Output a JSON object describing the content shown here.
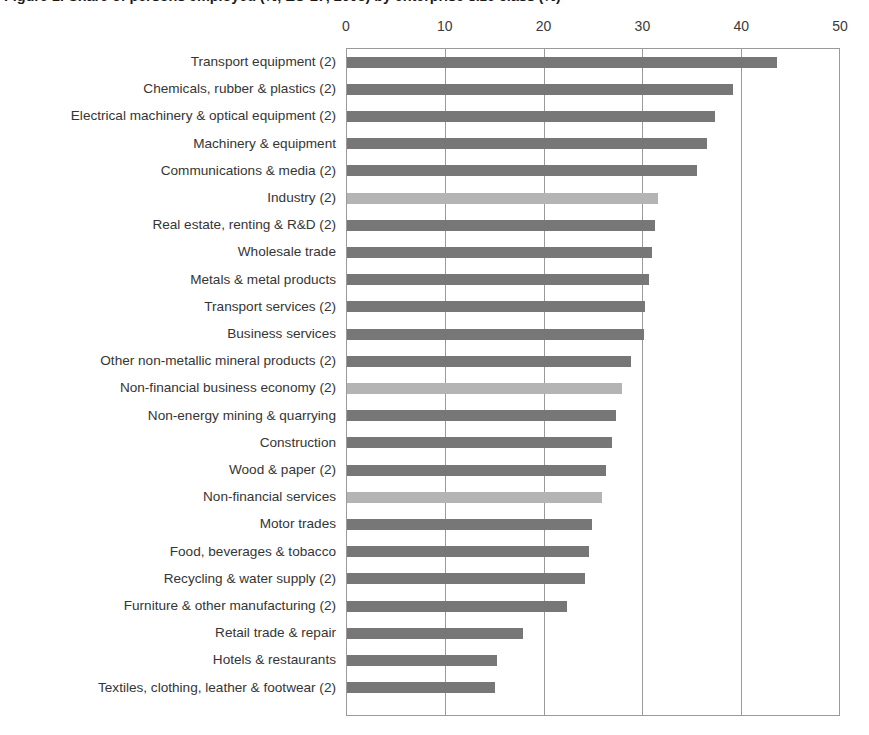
{
  "chart_data": {
    "type": "bar",
    "orientation": "horizontal",
    "title": "Figure 1: Share of persons employed (%, EU-27, 2008) by enterprise size class (%)",
    "xlabel": "",
    "ylabel": "",
    "xlim": [
      0,
      50
    ],
    "xticks": [
      0,
      10,
      20,
      30,
      40,
      50
    ],
    "xtick_labels": [
      "0",
      "10",
      "20",
      "30",
      "40",
      "50"
    ],
    "grid": true,
    "legend_position": "none",
    "colors": {
      "bar_primary": "#777777",
      "bar_aggregate": "#b4b4b4",
      "axis": "#9a9a9a",
      "text": "#353535",
      "background": "#ffffff"
    },
    "categories": [
      "Transport equipment (2)",
      "Chemicals, rubber & plastics (2)",
      "Electrical machinery & optical equipment (2)",
      "Machinery & equipment",
      "Communications & media (2)",
      "Industry (2)",
      "Real estate, renting & R&D (2)",
      "Wholesale trade",
      "Metals & metal products",
      "Transport services (2)",
      "Business services",
      "Other non-metallic mineral products (2)",
      "Non-financial business economy (2)",
      "Non-energy mining & quarrying",
      "Construction",
      "Wood & paper (2)",
      "Non-financial services",
      "Motor trades",
      "Food, beverages & tobacco",
      "Recycling & water supply (2)",
      "Furniture & other manufacturing (2)",
      "Retail trade & repair",
      "Hotels & restaurants",
      "Textiles, clothing, leather & footwear (2)"
    ],
    "values": [
      43.5,
      39.1,
      37.2,
      36.4,
      35.4,
      31.5,
      31.2,
      30.9,
      30.6,
      30.2,
      30.1,
      28.7,
      27.8,
      27.2,
      26.8,
      26.2,
      25.8,
      24.8,
      24.5,
      24.1,
      22.3,
      17.8,
      15.2,
      15.0
    ],
    "series_kinds": [
      "sector",
      "sector",
      "sector",
      "sector",
      "sector",
      "aggregate",
      "sector",
      "sector",
      "sector",
      "sector",
      "sector",
      "sector",
      "aggregate",
      "sector",
      "sector",
      "sector",
      "aggregate",
      "sector",
      "sector",
      "sector",
      "sector",
      "sector",
      "sector",
      "sector"
    ]
  }
}
